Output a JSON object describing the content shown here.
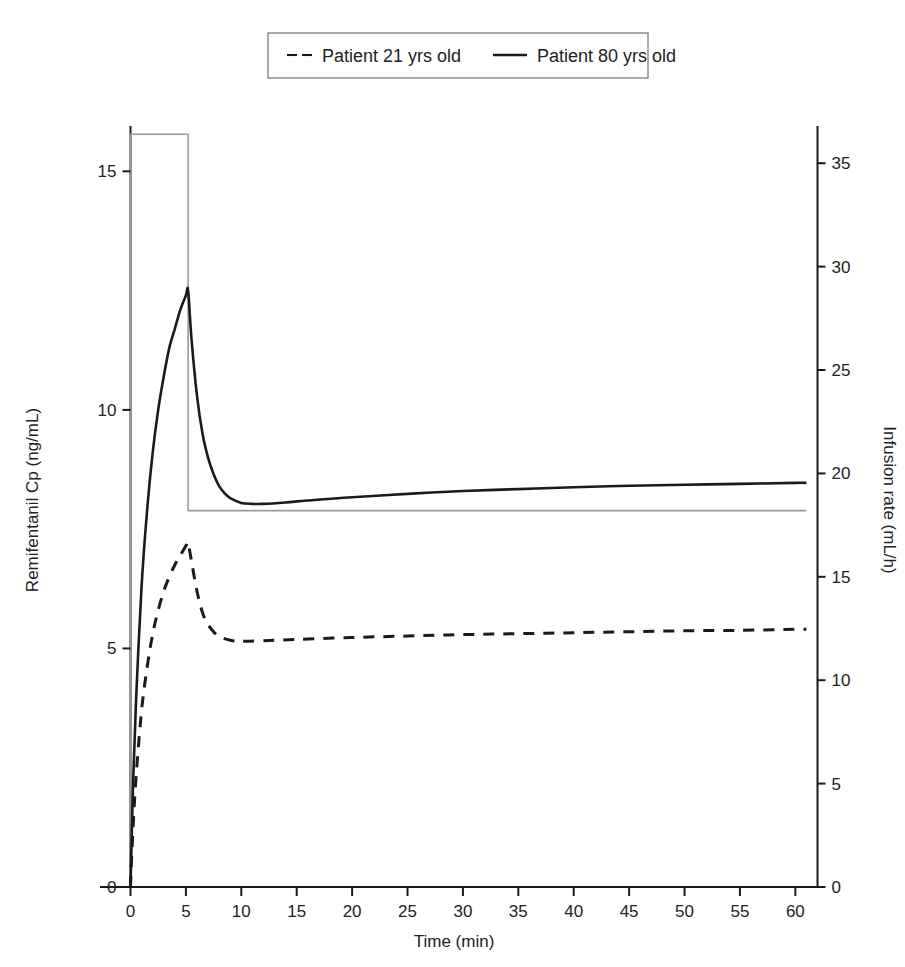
{
  "chart_data": {
    "type": "line",
    "title": "",
    "xlabel": "Time (min)",
    "ylabel": "Remifentanil Cp (ng/mL)",
    "y2label": "Infusion rate (mL/h)",
    "xlim": [
      0,
      62
    ],
    "ylim": [
      0,
      15.95
    ],
    "y2lim": [
      0,
      36.8
    ],
    "grid": false,
    "legend_position": "top-center",
    "xticks": [
      "0",
      "5",
      "10",
      "15",
      "20",
      "25",
      "30",
      "35",
      "40",
      "45",
      "50",
      "55",
      "60"
    ],
    "xtick_values": [
      0,
      5,
      10,
      15,
      20,
      25,
      30,
      35,
      40,
      45,
      50,
      55,
      60
    ],
    "yticks": [
      "0",
      "5",
      "10",
      "15"
    ],
    "ytick_values": [
      0,
      5,
      10,
      15
    ],
    "y2ticks": [
      "0",
      "5",
      "10",
      "15",
      "20",
      "25",
      "30",
      "35"
    ],
    "y2tick_values": [
      0,
      5,
      10,
      15,
      20,
      25,
      30,
      35
    ],
    "series": [
      {
        "name": "Patient 21 yrs old",
        "style": "dashed",
        "color": "#1a1a1a",
        "axis": "left",
        "x": [
          0,
          0.2,
          0.5,
          1,
          1.5,
          2,
          2.5,
          3,
          3.5,
          4,
          4.5,
          5,
          5.2,
          5.6,
          6,
          6.5,
          7,
          7.5,
          8,
          9,
          10,
          12,
          15,
          20,
          25,
          30,
          35,
          40,
          45,
          50,
          55,
          60,
          61
        ],
        "y": [
          0,
          1.1,
          2.3,
          3.7,
          4.6,
          5.3,
          5.8,
          6.2,
          6.5,
          6.75,
          6.95,
          7.15,
          7.2,
          6.7,
          6.2,
          5.75,
          5.5,
          5.35,
          5.25,
          5.17,
          5.15,
          5.16,
          5.19,
          5.23,
          5.26,
          5.29,
          5.31,
          5.33,
          5.35,
          5.37,
          5.38,
          5.4,
          5.4
        ]
      },
      {
        "name": "Patient 80 yrs old",
        "style": "solid",
        "color": "#1a1a1a",
        "axis": "left",
        "x": [
          0,
          0.2,
          0.5,
          1,
          1.5,
          2,
          2.5,
          3,
          3.5,
          4,
          4.5,
          5,
          5.2,
          5.5,
          6,
          6.5,
          7,
          7.5,
          8,
          8.5,
          9,
          10,
          11,
          12,
          14,
          16,
          20,
          25,
          30,
          35,
          40,
          45,
          50,
          55,
          60,
          61
        ],
        "y": [
          0,
          1.9,
          3.9,
          6.3,
          7.9,
          9.1,
          10.0,
          10.7,
          11.3,
          11.7,
          12.1,
          12.4,
          12.5,
          11.5,
          10.3,
          9.5,
          9.0,
          8.65,
          8.4,
          8.25,
          8.15,
          8.05,
          8.03,
          8.03,
          8.06,
          8.1,
          8.17,
          8.24,
          8.3,
          8.34,
          8.38,
          8.41,
          8.43,
          8.45,
          8.47,
          8.47
        ]
      },
      {
        "name": "Infusion rate",
        "style": "step",
        "color": "#9a9a9a",
        "axis": "right",
        "x": [
          0,
          0,
          5.2,
          5.2,
          61
        ],
        "y": [
          0,
          36.4,
          36.4,
          18.2,
          18.2
        ]
      }
    ],
    "legend": [
      {
        "label": "Patient 21 yrs old",
        "style": "dashed"
      },
      {
        "label": "Patient 80 yrs old",
        "style": "solid"
      }
    ]
  }
}
